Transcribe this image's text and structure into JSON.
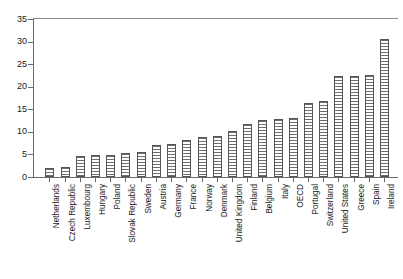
{
  "chart_data": {
    "type": "bar",
    "title": "",
    "subtitle": "",
    "xlabel": "",
    "ylabel": "",
    "ylim": [
      0,
      35
    ],
    "ytick_step": 5,
    "ytick_labels": [
      "0",
      "5",
      "10",
      "15",
      "20",
      "25",
      "30",
      "35"
    ],
    "grid": false,
    "legend": null,
    "orientation": "vertical",
    "bar_fill": "horizontal-hatch",
    "bar_edge_color": "#555555",
    "categories": [
      "Netherlands",
      "Czech Republic",
      "Luxembourg",
      "Hungary",
      "Poland",
      "Slovak Republic",
      "Sweden",
      "Austria",
      "Germany",
      "France",
      "Norway",
      "Denmark",
      "United Kingdom",
      "Finland",
      "Belgium",
      "Italy",
      "OECD",
      "Portugal",
      "Switzerland",
      "United States",
      "Greece",
      "Spain",
      "Ireland"
    ],
    "values": [
      2.0,
      2.3,
      4.6,
      4.8,
      4.8,
      5.4,
      5.5,
      7.0,
      7.3,
      8.3,
      8.8,
      9.0,
      10.3,
      11.8,
      12.6,
      12.8,
      13.0,
      16.3,
      16.8,
      22.4,
      22.4,
      22.6,
      30.5
    ]
  }
}
